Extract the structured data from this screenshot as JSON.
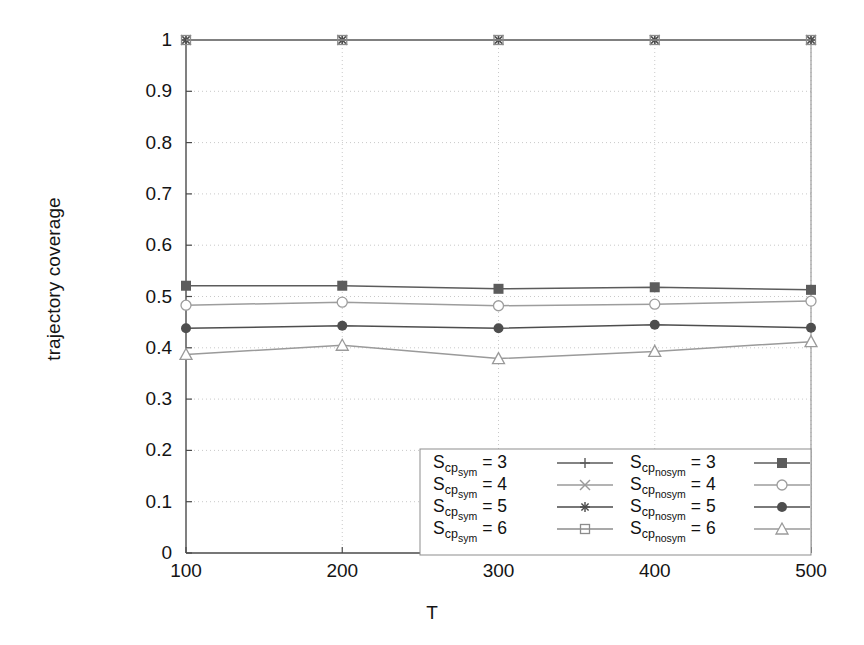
{
  "chart_data": {
    "type": "line",
    "title": "",
    "xlabel": "T",
    "ylabel": "trajectory coverage",
    "x": [
      100,
      200,
      300,
      400,
      500
    ],
    "xticklabels": [
      "100",
      "200",
      "300",
      "400",
      "500"
    ],
    "yticklabels": [
      "0",
      "0.1",
      "0.2",
      "0.3",
      "0.4",
      "0.5",
      "0.6",
      "0.7",
      "0.8",
      "0.9",
      "1"
    ],
    "ytickvalues": [
      0,
      0.1,
      0.2,
      0.3,
      0.4,
      0.5,
      0.6,
      0.7,
      0.8,
      0.9,
      1
    ],
    "xlim": [
      100,
      500
    ],
    "ylim": [
      0,
      1
    ],
    "grid": true,
    "legend_position": "lower right",
    "series": [
      {
        "name": "S_cpsym = 3",
        "label_base": "S",
        "label_sub": "cp",
        "label_sub2": "sym",
        "label_eq": "= 3",
        "marker": "plus",
        "filled": false,
        "color": "#5a5a5a",
        "values": [
          1.0,
          1.0,
          1.0,
          1.0,
          1.0
        ]
      },
      {
        "name": "S_cpsym = 4",
        "label_base": "S",
        "label_sub": "cp",
        "label_sub2": "sym",
        "label_eq": "= 4",
        "marker": "x-cross",
        "filled": false,
        "color": "#9a9a9a",
        "values": [
          1.0,
          1.0,
          1.0,
          1.0,
          1.0
        ]
      },
      {
        "name": "S_cpsym = 5",
        "label_base": "S",
        "label_sub": "cp",
        "label_sub2": "sym",
        "label_eq": "= 5",
        "marker": "asterisk",
        "filled": false,
        "color": "#4a4a4a",
        "values": [
          1.0,
          1.0,
          1.0,
          1.0,
          1.0
        ]
      },
      {
        "name": "S_cpsym = 6",
        "label_base": "S",
        "label_sub": "cp",
        "label_sub2": "sym",
        "label_eq": "= 6",
        "marker": "open-square",
        "filled": false,
        "color": "#8c8c8c",
        "values": [
          1.0,
          1.0,
          1.0,
          1.0,
          1.0
        ]
      },
      {
        "name": "S_cpnosym = 3",
        "label_base": "S",
        "label_sub": "cp",
        "label_sub2": "nosym",
        "label_eq": "= 3",
        "marker": "filled-square",
        "filled": true,
        "color": "#5c5c5c",
        "values": [
          0.521,
          0.521,
          0.515,
          0.518,
          0.513
        ]
      },
      {
        "name": "S_cpnosym = 4",
        "label_base": "S",
        "label_sub": "cp",
        "label_sub2": "nosym",
        "label_eq": "= 4",
        "marker": "open-circle",
        "filled": false,
        "color": "#9d9d9d",
        "values": [
          0.483,
          0.489,
          0.482,
          0.485,
          0.491
        ]
      },
      {
        "name": "S_cpnosym = 5",
        "label_base": "S",
        "label_sub": "cp",
        "label_sub2": "nosym",
        "label_eq": "= 5",
        "marker": "filled-circle",
        "filled": true,
        "color": "#4e4e4e",
        "values": [
          0.438,
          0.443,
          0.438,
          0.445,
          0.439
        ]
      },
      {
        "name": "S_cpnosym = 6",
        "label_base": "S",
        "label_sub": "cp",
        "label_sub2": "nosym",
        "label_eq": "= 6",
        "marker": "open-triangle",
        "filled": false,
        "color": "#9a9a9a",
        "values": [
          0.387,
          0.405,
          0.379,
          0.393,
          0.412
        ]
      }
    ]
  }
}
